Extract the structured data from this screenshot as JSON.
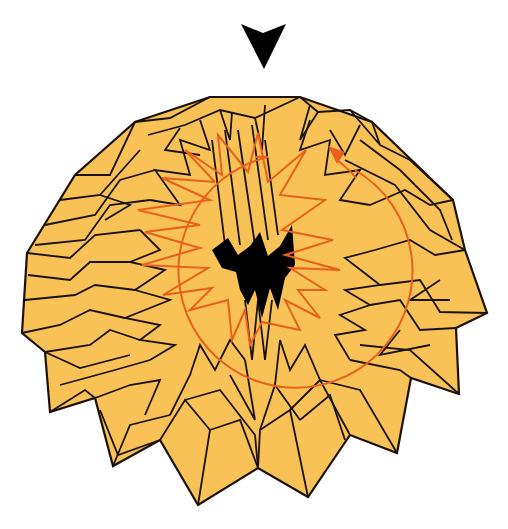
{
  "figure": {
    "colors": {
      "paper_fill": "#F9C256",
      "fold_line": "#1A1208",
      "center_hole": "#000000",
      "rotation_guide": "#E8601C",
      "background": "#FFFFFF"
    },
    "direction_marker": {
      "shape": "downward-arrowhead",
      "color": "#000000"
    },
    "rotation_indicator": {
      "shape": "circular-arc-arrow",
      "direction": "clockwise",
      "color": "#E8601C"
    }
  }
}
